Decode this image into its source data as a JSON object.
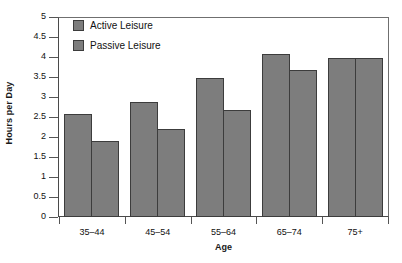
{
  "chart_data": {
    "type": "bar",
    "title": "",
    "xlabel": "Age",
    "ylabel": "Hours per Day",
    "categories": [
      "35–44",
      "45–54",
      "55–64",
      "65–74",
      "75+"
    ],
    "series": [
      {
        "name": "Active Leisure",
        "values": [
          2.6,
          2.9,
          3.5,
          4.1,
          4.0
        ]
      },
      {
        "name": "Passive Leisure",
        "values": [
          1.9,
          2.2,
          2.7,
          3.7,
          4.0
        ]
      }
    ],
    "ylim": [
      0,
      5
    ],
    "ytick_step": 0.5,
    "yticks": [
      "5",
      "4.5",
      "4",
      "3.5",
      "3",
      "2.5",
      "2",
      "1.5",
      "1",
      "0.5",
      "0"
    ],
    "ytick_values": [
      5,
      4.5,
      4,
      3.5,
      3,
      2.5,
      2,
      1.5,
      1,
      0.5,
      0
    ],
    "grid": false,
    "legend_position": "top-left-inside",
    "bar_color": "#7d7d7d",
    "bar_border_color": "#3c3c3c",
    "axis_color": "#4a4a4a",
    "frame_color": "#6f6f6f",
    "background": "#ffffff"
  },
  "legend": {
    "entries": [
      {
        "label": "Active Leisure"
      },
      {
        "label": "Passive Leisure"
      }
    ]
  },
  "axes": {
    "y_title": "Hours per Day",
    "x_title": "Age"
  }
}
